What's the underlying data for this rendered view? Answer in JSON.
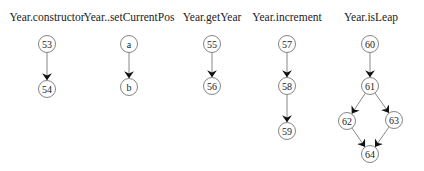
{
  "diagram": {
    "type": "control-flow-graphs",
    "graphs": [
      {
        "title": "Year.constructor",
        "title_x": 47,
        "nodes": [
          {
            "id": "53",
            "label": "53",
            "x": 47,
            "y": 44
          },
          {
            "id": "54",
            "label": "54",
            "x": 47,
            "y": 89
          }
        ],
        "edges": [
          {
            "from": "53",
            "to": "54"
          }
        ]
      },
      {
        "title": "Year..setCurrentPos",
        "title_x": 129,
        "nodes": [
          {
            "id": "a",
            "label": "a",
            "x": 129,
            "y": 44
          },
          {
            "id": "b",
            "label": "b",
            "x": 129,
            "y": 87
          }
        ],
        "edges": [
          {
            "from": "a",
            "to": "b"
          }
        ]
      },
      {
        "title": "Year.getYear",
        "title_x": 212,
        "nodes": [
          {
            "id": "55",
            "label": "55",
            "x": 212,
            "y": 44
          },
          {
            "id": "56",
            "label": "56",
            "x": 212,
            "y": 86
          }
        ],
        "edges": [
          {
            "from": "55",
            "to": "56"
          }
        ]
      },
      {
        "title": "Year.increment",
        "title_x": 287,
        "nodes": [
          {
            "id": "57",
            "label": "57",
            "x": 287,
            "y": 44
          },
          {
            "id": "58",
            "label": "58",
            "x": 287,
            "y": 86
          },
          {
            "id": "59",
            "label": "59",
            "x": 287,
            "y": 131
          }
        ],
        "edges": [
          {
            "from": "57",
            "to": "58"
          },
          {
            "from": "58",
            "to": "59"
          }
        ]
      },
      {
        "title": "Year.isLeap",
        "title_x": 371,
        "nodes": [
          {
            "id": "60",
            "label": "60",
            "x": 370,
            "y": 44
          },
          {
            "id": "61",
            "label": "61",
            "x": 370,
            "y": 86
          },
          {
            "id": "62",
            "label": "62",
            "x": 347,
            "y": 121
          },
          {
            "id": "63",
            "label": "63",
            "x": 394,
            "y": 120
          },
          {
            "id": "64",
            "label": "64",
            "x": 370,
            "y": 154
          }
        ],
        "edges": [
          {
            "from": "60",
            "to": "61"
          },
          {
            "from": "61",
            "to": "62"
          },
          {
            "from": "61",
            "to": "63"
          },
          {
            "from": "62",
            "to": "64"
          },
          {
            "from": "63",
            "to": "64"
          }
        ]
      }
    ]
  }
}
